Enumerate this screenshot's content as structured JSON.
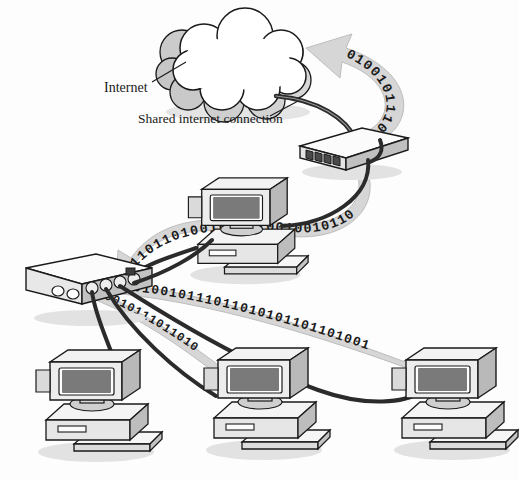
{
  "diagram": {
    "type": "network-topology",
    "background_color": "#fdfdfd",
    "labels": {
      "internet": "Internet",
      "shared_connection": "Shared internet connection"
    },
    "palette": {
      "outline": "#1a1a1a",
      "cable": "#2b2b2b",
      "arrow_fill": "#d2d2d2",
      "arrow_edge": "#b4b4b4",
      "screen": "#777777",
      "case_light": "#f2f2f2",
      "case_mid": "#d8d8d8",
      "case_dark": "#b0b0b0",
      "shadow": "#d9d9d9",
      "cloud_fill": "#ffffff",
      "cloud_shade": "#c9c9c9"
    },
    "nodes": [
      {
        "name": "internet-cloud",
        "label": "Internet",
        "x": 235,
        "y": 62
      },
      {
        "name": "router-device",
        "label": "",
        "x": 340,
        "y": 145
      },
      {
        "name": "hub-device",
        "label": "",
        "x": 88,
        "y": 283
      },
      {
        "name": "computer-left",
        "label": "",
        "x": 98,
        "y": 400
      },
      {
        "name": "computer-middle",
        "label": "",
        "x": 262,
        "y": 398
      },
      {
        "name": "computer-right",
        "label": "",
        "x": 450,
        "y": 398
      },
      {
        "name": "computer-top",
        "label": "",
        "x": 248,
        "y": 215
      }
    ],
    "data_streams": [
      {
        "name": "stream-to-internet",
        "direction": "router-to-cloud",
        "bits": "1001010010111011011010",
        "arrowhead": "upper-left"
      },
      {
        "name": "stream-to-top-computer",
        "direction": "router-to-computer-top",
        "bits": "1101101001011010010010110",
        "arrowhead": "lower-left"
      },
      {
        "name": "stream-hub-to-right-computer",
        "direction": "hub-to-computer-right",
        "bits": "001010010111011010101101101001",
        "arrowhead": "lower-right"
      },
      {
        "name": "stream-hub-to-middle-computer",
        "direction": "hub-to-computer-middle",
        "bits": "0010111011010",
        "arrowhead": "lower-right"
      }
    ],
    "connections": [
      {
        "name": "cable-cloud-to-router",
        "from": "internet-cloud",
        "to": "router-device"
      },
      {
        "name": "cable-router-to-hub",
        "from": "router-device",
        "to": "hub-device"
      },
      {
        "name": "cable-hub-to-computer-left",
        "from": "hub-device",
        "to": "computer-left"
      },
      {
        "name": "cable-hub-to-computer-middle",
        "from": "hub-device",
        "to": "computer-middle"
      },
      {
        "name": "cable-hub-to-computer-right",
        "from": "hub-device",
        "to": "computer-right"
      },
      {
        "name": "cable-hub-to-computer-top",
        "from": "hub-device",
        "to": "computer-top"
      }
    ]
  }
}
